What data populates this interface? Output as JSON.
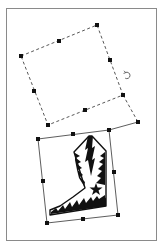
{
  "canvas": {
    "width": 165,
    "height": 247,
    "background": "#ffffff",
    "frame_color": "#8a8a8a"
  },
  "ghost_selection": {
    "style": "dashed",
    "color": "#444444",
    "corners": [
      [
        21,
        56
      ],
      [
        97,
        25
      ],
      [
        123,
        95
      ],
      [
        48,
        125
      ]
    ],
    "extension": [
      [
        123,
        95
      ],
      [
        138,
        122
      ]
    ],
    "handles": [
      [
        21,
        56
      ],
      [
        59,
        41
      ],
      [
        97,
        25
      ],
      [
        110,
        60
      ],
      [
        123,
        95
      ],
      [
        85,
        110
      ],
      [
        48,
        125
      ],
      [
        34,
        91
      ]
    ]
  },
  "rotate_cursor": {
    "icon": "rotate-arrow-icon",
    "x": 127,
    "y": 75
  },
  "active_selection": {
    "style": "solid",
    "color": "#333333",
    "corners": [
      [
        38,
        139
      ],
      [
        109,
        130
      ],
      [
        118,
        215
      ],
      [
        47,
        223
      ]
    ],
    "extension": [
      [
        109,
        130
      ],
      [
        138,
        122
      ]
    ],
    "handles": [
      [
        38,
        139
      ],
      [
        73,
        134
      ],
      [
        109,
        130
      ],
      [
        138,
        122
      ],
      [
        114,
        172
      ],
      [
        118,
        215
      ],
      [
        83,
        219
      ],
      [
        47,
        223
      ],
      [
        43,
        181
      ]
    ]
  },
  "object": {
    "name": "cowboy-boot clipart",
    "fill": "#111111"
  }
}
